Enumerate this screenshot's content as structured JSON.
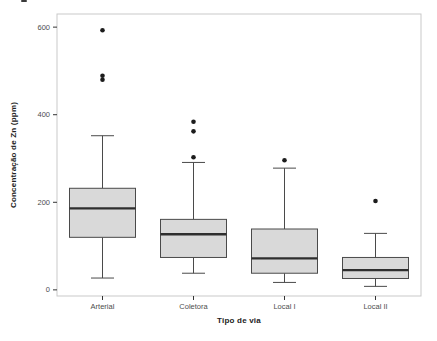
{
  "chart_data": {
    "type": "boxplot",
    "title": "",
    "xlabel": "Tipo de via",
    "ylabel": "Concentração de Zn (ppm)",
    "categories": [
      "Arterial",
      "Coletora",
      "Local I",
      "Local II"
    ],
    "y_ticks": [
      0,
      200,
      400,
      600
    ],
    "ylim": [
      -14,
      630
    ],
    "grid": "off",
    "legend": "none",
    "series": [
      {
        "category": "Arterial",
        "whisker_low": 27,
        "q1": 120,
        "median": 186,
        "q3": 232,
        "whisker_high": 352,
        "outliers": [
          480,
          489,
          593
        ]
      },
      {
        "category": "Coletora",
        "whisker_low": 38,
        "q1": 74,
        "median": 127,
        "q3": 161,
        "whisker_high": 291,
        "outliers": [
          303,
          362,
          384
        ]
      },
      {
        "category": "Local I",
        "whisker_low": 17,
        "q1": 38,
        "median": 72,
        "q3": 139,
        "whisker_high": 278,
        "outliers": [
          296
        ]
      },
      {
        "category": "Local II",
        "whisker_low": 8,
        "q1": 26,
        "median": 45,
        "q3": 74,
        "whisker_high": 129,
        "outliers": [
          203
        ]
      }
    ],
    "colors": {
      "background": "#ffffff",
      "panel_border": "#c9c9c9",
      "box_fill": "#d9d9d9",
      "box_border": "#4a4a4a",
      "median": "#2e2e2e",
      "whisker": "#4a4a4a",
      "outlier": "#1c1c1c",
      "tick": "#333333",
      "tick_label": "#4d4d4d"
    }
  }
}
